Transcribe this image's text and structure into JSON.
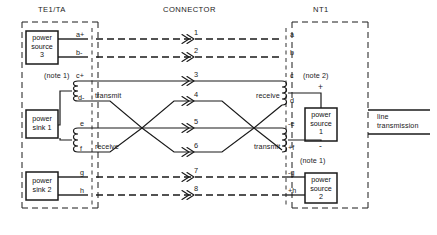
{
  "diagram": {
    "headers": {
      "left": "TE1/TA",
      "middle": "CONNECTOR",
      "right": "NT1"
    },
    "left_boxes": [
      {
        "id": "power-source-3",
        "lines": [
          "power",
          "source",
          "3"
        ]
      },
      {
        "id": "power-sink-1",
        "lines": [
          "power",
          "sink 1"
        ]
      },
      {
        "id": "power-sink-2",
        "lines": [
          "power",
          "sink 2"
        ]
      }
    ],
    "right_boxes": [
      {
        "id": "power-source-1",
        "lines": [
          "power",
          "source",
          "1"
        ]
      },
      {
        "id": "power-source-2",
        "lines": [
          "power",
          "source",
          "2"
        ]
      }
    ],
    "left_pins": [
      {
        "id": "a",
        "label": "a+"
      },
      {
        "id": "b",
        "label": "b-"
      },
      {
        "id": "c",
        "label": "c+"
      },
      {
        "id": "d",
        "label": "d-"
      },
      {
        "id": "e",
        "label": "e"
      },
      {
        "id": "f",
        "label": "f"
      },
      {
        "id": "g",
        "label": "g"
      },
      {
        "id": "h",
        "label": "h"
      }
    ],
    "right_pins": [
      {
        "id": "a",
        "label": "a"
      },
      {
        "id": "b",
        "label": "b"
      },
      {
        "id": "c",
        "label": "c"
      },
      {
        "id": "d",
        "label": "d"
      },
      {
        "id": "e",
        "label": "-e"
      },
      {
        "id": "f",
        "label": "+f"
      },
      {
        "id": "g",
        "label": "-g"
      },
      {
        "id": "h",
        "label": "+h"
      }
    ],
    "connector_numbers": [
      "1",
      "2",
      "3",
      "4",
      "5",
      "6",
      "7",
      "8"
    ],
    "pair_labels": {
      "left_transmit": "transmit",
      "left_receive": "receive",
      "right_receive": "receive",
      "right_transmit": "transmit"
    },
    "notes": [
      {
        "id": "note-1-left",
        "text": "(note 1)"
      },
      {
        "id": "note-2-right",
        "text": "(note 2)"
      },
      {
        "id": "note-1-right",
        "text": "(note 1)"
      }
    ],
    "polarity": {
      "source1_plus": "+",
      "source1_minus": "-"
    },
    "line_transmission": {
      "line1": "line",
      "line2": "transmission"
    },
    "colors": {
      "stroke": "#1a1a1a",
      "background": "#ffffff",
      "text": "#111111"
    }
  }
}
